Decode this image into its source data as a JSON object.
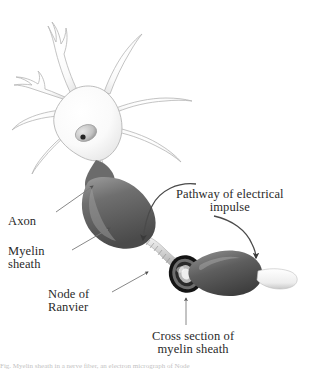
{
  "figure": {
    "background_color": "#ffffff",
    "text_color": "#2a2a2a",
    "width": 311,
    "height": 372
  },
  "labels": {
    "axon": "Axon",
    "myelin_sheath": "Myelin\nsheath",
    "node_of_ranvier": "Node of\nRanvier",
    "pathway": "Pathway of electrical\nimpulse",
    "cross_section": "Cross section of\nmyelin sheath"
  },
  "caption": {
    "text": "Fig. Myelin sheath in a nerve fiber, an electron micrograph of Node"
  },
  "anatomy": {
    "soma_label": "cell-body",
    "nucleus_label": "nucleus",
    "nucleolus_label": "nucleolus",
    "dendrite_count": 8,
    "myelin_segment_count": 3,
    "node_count": 2
  },
  "colors": {
    "soma_fill": "#fbfbfb",
    "soma_outline": "#b9b9b9",
    "nucleus_fill": "#cfcfcf",
    "nucleolus_fill": "#2b2b2b",
    "myelin_dark": "#5c5c5c",
    "myelin_mid": "#8a8a8a",
    "myelin_light": "#d8d8d8",
    "node_fill": "#e4e4e4",
    "cross_ring_outer": "#1c1c1c",
    "cross_ring_inner": "#c9c9c9",
    "arrow_color": "#4a4a4a",
    "pointer_color": "#6e6e6e"
  }
}
